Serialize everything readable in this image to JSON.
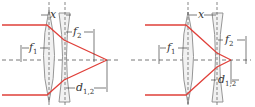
{
  "colors": {
    "ray": "#e0403a",
    "axis": "#555555",
    "lens_fill": "#f1f1f1",
    "lens_stroke": "#8a8a8a",
    "dim": "#444444"
  },
  "panels": [
    {
      "id": "left",
      "labels": {
        "x": "x",
        "f1": "f",
        "f1_sub": "1",
        "f2": "f",
        "f2_sub": "2",
        "d": "d",
        "d_sub": "1,2"
      }
    },
    {
      "id": "right",
      "labels": {
        "x": "x",
        "f1": "f",
        "f1_sub": "1",
        "f2": "f",
        "f2_sub": "2",
        "d": "d",
        "d_sub": "1,2"
      }
    }
  ]
}
